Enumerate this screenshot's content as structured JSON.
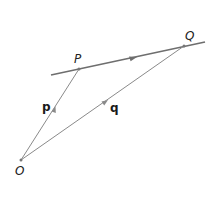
{
  "diagram": {
    "type": "vector-geometry",
    "points": {
      "O": {
        "label": "O",
        "x": 21,
        "y": 160
      },
      "P": {
        "label": "P",
        "x": 79,
        "y": 69
      },
      "Q": {
        "label": "Q",
        "x": 184,
        "y": 46
      }
    },
    "vectors": {
      "p": {
        "label": "p",
        "from": "O",
        "to": "P"
      },
      "q": {
        "label": "q",
        "from": "O",
        "to": "Q"
      }
    },
    "line": {
      "through": [
        "P",
        "Q"
      ],
      "direction_arrow": "P to Q"
    },
    "colors": {
      "line": "#6e6e6e",
      "vector": "#8a8a8a",
      "text": "#222222"
    }
  }
}
